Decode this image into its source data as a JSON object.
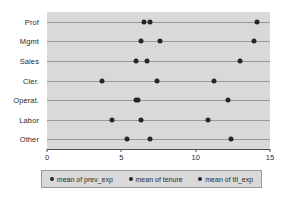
{
  "chart_data": {
    "type": "scatter",
    "title": "",
    "xlabel": "",
    "ylabel": "",
    "xlim": [
      0,
      15
    ],
    "xticks": [
      0,
      5,
      10,
      15
    ],
    "xtick_labels": [
      "0",
      "5",
      "10",
      "15"
    ],
    "grid": true,
    "legend_position": "bottom",
    "categories": [
      "Prof",
      "Mgmt",
      "Sales",
      "Cler.",
      "Operat.",
      "Labor",
      "Other"
    ],
    "series": [
      {
        "name": "mean of prev_exp",
        "marker": "circle",
        "color": "#262626",
        "values": [
          6.5,
          6.3,
          6.0,
          3.7,
          6.0,
          4.4,
          5.4
        ]
      },
      {
        "name": "mean of tenure",
        "marker": "circle",
        "color": "#262626",
        "values": [
          6.9,
          7.6,
          6.7,
          7.4,
          6.1,
          6.3,
          6.9
        ]
      },
      {
        "name": "mean of ttl_exp",
        "marker": "circle",
        "color": "#262626",
        "values": [
          14.1,
          13.9,
          13.0,
          11.2,
          12.2,
          10.8,
          12.4
        ]
      }
    ]
  },
  "legend": {
    "entries": [
      "mean of prev_exp",
      "mean of tenure",
      "mean of ttl_exp"
    ]
  },
  "colors": {
    "plot_background": "#d9d9d9",
    "marker": "#262626",
    "gridline": "#9a9a9a",
    "axis": "#4d4d4d",
    "page_background": "#ffffff"
  }
}
